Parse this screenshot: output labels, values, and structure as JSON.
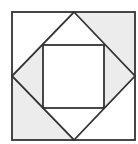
{
  "diagram": {
    "colors": {
      "background": "#ffffff",
      "shade": "#ececec",
      "stroke": "#333333"
    },
    "outer_square": {
      "x1": 12,
      "y1": 12,
      "x2": 135,
      "y2": 140
    },
    "diamond": {
      "top": [
        74,
        12
      ],
      "right": [
        135,
        76
      ],
      "bottom": [
        74,
        140
      ],
      "left": [
        12,
        76
      ]
    },
    "inner_square": {
      "x1": 43,
      "y1": 45,
      "x2": 104,
      "y2": 108
    },
    "shaded_regions": [
      "top-right-corner",
      "bottom-left-corner",
      "left-side-triangle",
      "right-side-triangle"
    ],
    "unshaded_regions": [
      "top-left-corner",
      "bottom-right-corner",
      "top-triangle",
      "bottom-triangle",
      "inner-square"
    ]
  }
}
